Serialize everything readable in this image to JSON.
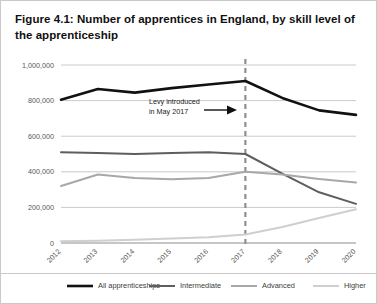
{
  "figure": {
    "title": "Figure 4.1: Number of apprentices in England, by skill level of the apprenticeship"
  },
  "annotation": {
    "line1": "Levy introduced",
    "line2": "in May 2017",
    "marker_year": "2017",
    "arrow_icon": "right-arrow-icon"
  },
  "colors": {
    "all": "#111111",
    "intermediate": "#5e5e5e",
    "advanced": "#a8a8a8",
    "higher": "#cfcfcf",
    "grid": "#c4c4c4",
    "axis": "#8d8d8d",
    "marker_line": "#8f8f8f",
    "text": "#585858",
    "frame": "#c9c9c9"
  },
  "chart_data": {
    "type": "line",
    "title": "Figure 4.1: Number of apprentices in England, by skill level of the apprenticeship",
    "xlabel": "",
    "ylabel": "",
    "grid": true,
    "legend_position": "bottom",
    "x": [
      "2012",
      "2013",
      "2014",
      "2015",
      "2016",
      "2017",
      "2018",
      "2019",
      "2020"
    ],
    "xtick_labels": [
      "2012",
      "2013",
      "2014",
      "2015",
      "2016",
      "2017",
      "2018",
      "2019",
      "2020"
    ],
    "ytick_labels": [
      "0",
      "200,000",
      "400,000",
      "600,000",
      "800,000",
      "1,000,000"
    ],
    "ytick_values": [
      0,
      200000,
      400000,
      600000,
      800000,
      1000000
    ],
    "ylim": [
      0,
      1000000
    ],
    "series": [
      {
        "name": "All apprenticeships",
        "color_key": "all",
        "values": [
          805000,
          865000,
          845000,
          870000,
          890000,
          910000,
          815000,
          745000,
          720000
        ]
      },
      {
        "name": "Intermediate",
        "color_key": "intermediate",
        "values": [
          510000,
          505000,
          500000,
          505000,
          510000,
          500000,
          390000,
          285000,
          220000
        ]
      },
      {
        "name": "Advanced",
        "color_key": "advanced",
        "values": [
          320000,
          385000,
          365000,
          358000,
          365000,
          400000,
          385000,
          360000,
          340000
        ]
      },
      {
        "name": "Higher",
        "color_key": "higher",
        "values": [
          10000,
          12000,
          18000,
          25000,
          32000,
          48000,
          90000,
          140000,
          190000
        ]
      }
    ],
    "annotations": [
      {
        "text": "Levy introduced in May 2017",
        "type": "vertical-marker",
        "at_x": "2017",
        "style": "dashed"
      }
    ]
  },
  "legend": {
    "items": [
      {
        "label": "All apprenticeships",
        "color_key": "all"
      },
      {
        "label": "Intermediate",
        "color_key": "intermediate"
      },
      {
        "label": "Advanced",
        "color_key": "advanced"
      },
      {
        "label": "Higher",
        "color_key": "higher"
      }
    ]
  }
}
